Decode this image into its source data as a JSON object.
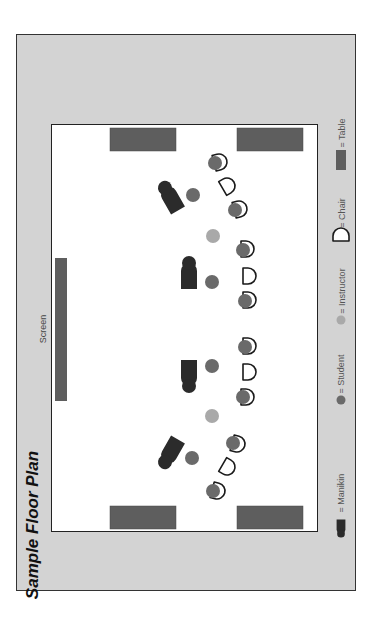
{
  "title": "Sample Floor Plan",
  "screen": {
    "label": "Screen",
    "x": 55,
    "y": 258,
    "w": 12,
    "h": 143
  },
  "colors": {
    "frame_bg": "#d3d3d3",
    "room_bg": "#ffffff",
    "table": "#5e5e5e",
    "screen": "#5e5e5e",
    "manikin": "#2b2b2b",
    "student": "#6a6a6a",
    "instructor": "#a9a9a9",
    "chair_stroke": "#1a1a1a"
  },
  "legend": [
    {
      "icon": "manikin-icon",
      "label": "= Manikin",
      "y": 520
    },
    {
      "icon": "student-icon",
      "label": "= Student",
      "y": 400
    },
    {
      "icon": "instructor-icon",
      "label": "= Instructor",
      "y": 320
    },
    {
      "icon": "chair-icon",
      "label": "= Chair",
      "y": 236
    },
    {
      "icon": "table-icon",
      "label": "= Table",
      "y": 160
    }
  ],
  "tables": [
    {
      "x": 110,
      "y": 128,
      "w": 66,
      "h": 23
    },
    {
      "x": 237,
      "y": 128,
      "w": 66,
      "h": 23
    },
    {
      "x": 110,
      "y": 506,
      "w": 66,
      "h": 23
    },
    {
      "x": 237,
      "y": 506,
      "w": 66,
      "h": 23
    }
  ],
  "manikins": [
    {
      "x": 172,
      "y": 200,
      "rot": -30
    },
    {
      "x": 189,
      "y": 277,
      "rot": 0
    },
    {
      "x": 189,
      "y": 372,
      "rot": 180
    },
    {
      "x": 172,
      "y": 450,
      "rot": 210
    }
  ],
  "students": [
    {
      "x": 215,
      "y": 163
    },
    {
      "x": 193,
      "y": 195
    },
    {
      "x": 235,
      "y": 210
    },
    {
      "x": 243,
      "y": 250
    },
    {
      "x": 212,
      "y": 282
    },
    {
      "x": 245,
      "y": 301
    },
    {
      "x": 245,
      "y": 347
    },
    {
      "x": 212,
      "y": 366
    },
    {
      "x": 243,
      "y": 397
    },
    {
      "x": 233,
      "y": 443
    },
    {
      "x": 192,
      "y": 458
    },
    {
      "x": 213,
      "y": 491
    }
  ],
  "instructors": [
    {
      "x": 213,
      "y": 236
    },
    {
      "x": 212,
      "y": 416
    }
  ],
  "chairs": [
    {
      "x": 219,
      "y": 162,
      "rot": -15,
      "occupied": true
    },
    {
      "x": 227,
      "y": 186,
      "rot": -30,
      "occupied": false
    },
    {
      "x": 239,
      "y": 209,
      "rot": -15,
      "occupied": true
    },
    {
      "x": 246,
      "y": 249,
      "rot": 0,
      "occupied": true
    },
    {
      "x": 248,
      "y": 276,
      "rot": 0,
      "occupied": false
    },
    {
      "x": 248,
      "y": 300,
      "rot": 0,
      "occupied": true
    },
    {
      "x": 248,
      "y": 346,
      "rot": 0,
      "occupied": true
    },
    {
      "x": 248,
      "y": 372,
      "rot": 0,
      "occupied": false
    },
    {
      "x": 246,
      "y": 397,
      "rot": 0,
      "occupied": true
    },
    {
      "x": 237,
      "y": 444,
      "rot": 15,
      "occupied": true
    },
    {
      "x": 227,
      "y": 467,
      "rot": 30,
      "occupied": false
    },
    {
      "x": 217,
      "y": 491,
      "rot": 15,
      "occupied": true
    }
  ]
}
